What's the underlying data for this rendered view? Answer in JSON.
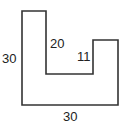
{
  "figure": {
    "labels": {
      "left_side": "30",
      "inner_left_side": "20",
      "inner_right_side": "11",
      "bottom_side": "30"
    },
    "colors": {
      "stroke": "#333333",
      "background": "#ffffff",
      "text": "#222222"
    }
  }
}
